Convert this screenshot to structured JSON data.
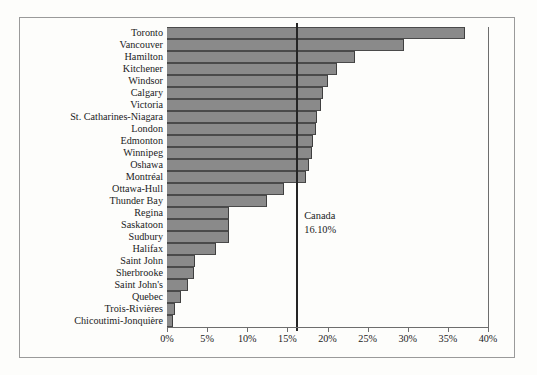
{
  "chart_data": {
    "type": "bar",
    "orientation": "horizontal",
    "title": "",
    "xlabel": "",
    "ylabel": "",
    "xlim": [
      0,
      40
    ],
    "xtick_labels": [
      "0%",
      "5%",
      "10%",
      "15%",
      "20%",
      "25%",
      "30%",
      "35%",
      "40%"
    ],
    "xticks": [
      0,
      5,
      10,
      15,
      20,
      25,
      30,
      35,
      40
    ],
    "grid": false,
    "legend": null,
    "bar_color": "#8a8a8a",
    "categories": [
      "Toronto",
      "Vancouver",
      "Hamilton",
      "Kitchener",
      "Windsor",
      "Calgary",
      "Victoria",
      "St. Catharines-Niagara",
      "London",
      "Edmonton",
      "Winnipeg",
      "Oshawa",
      "Montréal",
      "Ottawa-Hull",
      "Thunder Bay",
      "Regina",
      "Saskatoon",
      "Sudbury",
      "Halifax",
      "Saint John",
      "Sherbrooke",
      "Saint John's",
      "Quebec",
      "Trois-Rivières",
      "Chicoutimi-Jonquière"
    ],
    "values": [
      37.1,
      29.5,
      23.4,
      21.2,
      20.1,
      19.4,
      19.2,
      18.7,
      18.6,
      18.2,
      18.1,
      17.7,
      17.3,
      14.6,
      12.5,
      7.7,
      7.7,
      7.7,
      6.1,
      3.5,
      3.4,
      2.6,
      1.7,
      1.0,
      0.7
    ],
    "annotations": [
      {
        "name": "canada-reference-line",
        "label_line1": "Canada",
        "label_line2": "16.10%",
        "value": 16.1
      }
    ]
  }
}
